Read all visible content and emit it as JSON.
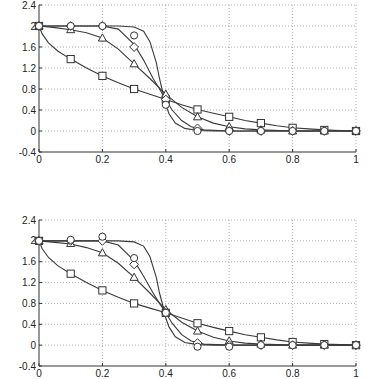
{
  "chart_data": [
    {
      "type": "line",
      "title": "",
      "xlabel": "",
      "ylabel": "",
      "xlim": [
        0,
        1
      ],
      "ylim": [
        -0.4,
        2.4
      ],
      "grid": true,
      "x_ticks": [
        "0",
        "0.2",
        "0.4",
        "0.6",
        "0.8",
        "1"
      ],
      "y_ticks": [
        "-0.4",
        "0",
        "0.4",
        "0.8",
        "1.2",
        "1.6",
        "2",
        "2.4"
      ],
      "x": [
        0,
        0.1,
        0.2,
        0.3,
        0.4,
        0.5,
        0.6,
        0.7,
        0.8,
        0.9,
        1.0
      ],
      "series": [
        {
          "name": "square",
          "marker": "square",
          "values": [
            2.0,
            1.37,
            1.05,
            0.8,
            0.6,
            0.41,
            0.27,
            0.15,
            0.06,
            0.02,
            0.0
          ]
        },
        {
          "name": "triangle",
          "marker": "triangle",
          "values": [
            2.0,
            1.93,
            1.77,
            1.28,
            0.7,
            0.27,
            0.08,
            0.02,
            0.0,
            0.0,
            0.0
          ]
        },
        {
          "name": "diamond",
          "marker": "diamond",
          "values": [
            2.0,
            2.0,
            2.0,
            1.6,
            0.6,
            0.05,
            0.0,
            0.0,
            0.0,
            0.0,
            0.0
          ]
        },
        {
          "name": "circle",
          "marker": "circle",
          "values": [
            2.0,
            2.0,
            2.0,
            1.82,
            0.5,
            0.0,
            0.0,
            0.0,
            0.0,
            0.0,
            0.0
          ]
        }
      ],
      "curves": [
        {
          "name": "curve-square",
          "points": [
            [
              0,
              2.0
            ],
            [
              0.01,
              1.85
            ],
            [
              0.03,
              1.68
            ],
            [
              0.06,
              1.52
            ],
            [
              0.1,
              1.37
            ],
            [
              0.15,
              1.2
            ],
            [
              0.2,
              1.05
            ],
            [
              0.25,
              0.92
            ],
            [
              0.3,
              0.8
            ],
            [
              0.35,
              0.7
            ],
            [
              0.4,
              0.6
            ],
            [
              0.45,
              0.5
            ],
            [
              0.5,
              0.41
            ],
            [
              0.55,
              0.34
            ],
            [
              0.6,
              0.27
            ],
            [
              0.65,
              0.2
            ],
            [
              0.7,
              0.15
            ],
            [
              0.75,
              0.1
            ],
            [
              0.8,
              0.06
            ],
            [
              0.85,
              0.04
            ],
            [
              0.9,
              0.02
            ],
            [
              0.95,
              0.01
            ],
            [
              1,
              0
            ]
          ]
        },
        {
          "name": "curve-triangle",
          "points": [
            [
              0,
              2.0
            ],
            [
              0.05,
              1.97
            ],
            [
              0.1,
              1.93
            ],
            [
              0.15,
              1.87
            ],
            [
              0.2,
              1.77
            ],
            [
              0.25,
              1.56
            ],
            [
              0.3,
              1.28
            ],
            [
              0.35,
              1.0
            ],
            [
              0.4,
              0.7
            ],
            [
              0.45,
              0.45
            ],
            [
              0.5,
              0.27
            ],
            [
              0.55,
              0.15
            ],
            [
              0.6,
              0.08
            ],
            [
              0.65,
              0.04
            ],
            [
              0.7,
              0.02
            ],
            [
              0.8,
              0.0
            ],
            [
              1,
              0
            ]
          ]
        },
        {
          "name": "curve-diamond",
          "points": [
            [
              0,
              2.0
            ],
            [
              0.2,
              2.0
            ],
            [
              0.25,
              1.94
            ],
            [
              0.3,
              1.65
            ],
            [
              0.33,
              1.35
            ],
            [
              0.36,
              1.0
            ],
            [
              0.38,
              0.8
            ],
            [
              0.4,
              0.6
            ],
            [
              0.42,
              0.4
            ],
            [
              0.45,
              0.2
            ],
            [
              0.48,
              0.08
            ],
            [
              0.52,
              0.02
            ],
            [
              0.6,
              0.0
            ],
            [
              1,
              0
            ]
          ]
        },
        {
          "name": "curve-steep",
          "points": [
            [
              0,
              2.0
            ],
            [
              0.25,
              2.0
            ],
            [
              0.3,
              1.98
            ],
            [
              0.33,
              1.9
            ],
            [
              0.35,
              1.7
            ],
            [
              0.37,
              1.3
            ],
            [
              0.38,
              1.0
            ],
            [
              0.39,
              0.75
            ],
            [
              0.4,
              0.5
            ],
            [
              0.41,
              0.33
            ],
            [
              0.43,
              0.15
            ],
            [
              0.46,
              0.05
            ],
            [
              0.5,
              0.01
            ],
            [
              0.55,
              0.0
            ],
            [
              1,
              0
            ]
          ]
        }
      ]
    },
    {
      "type": "line",
      "title": "",
      "xlabel": "",
      "ylabel": "",
      "xlim": [
        0,
        1
      ],
      "ylim": [
        -0.4,
        2.4
      ],
      "grid": true,
      "x_ticks": [
        "0",
        "0.2",
        "0.4",
        "0.6",
        "0.8",
        "1"
      ],
      "y_ticks": [
        "-0.4",
        "0",
        "0.4",
        "0.8",
        "1.2",
        "1.6",
        "2",
        "2.4"
      ],
      "x": [
        0,
        0.1,
        0.2,
        0.3,
        0.4,
        0.5,
        0.6,
        0.7,
        0.8,
        0.9,
        1.0
      ],
      "series": [
        {
          "name": "square",
          "marker": "square",
          "values": [
            2.0,
            1.37,
            1.05,
            0.8,
            0.62,
            0.42,
            0.27,
            0.15,
            0.06,
            0.02,
            0.0
          ]
        },
        {
          "name": "triangle",
          "marker": "triangle",
          "values": [
            2.0,
            1.95,
            1.77,
            1.3,
            0.68,
            0.27,
            0.08,
            0.02,
            0.0,
            0.0,
            0.0
          ]
        },
        {
          "name": "diamond",
          "marker": "diamond",
          "values": [
            2.0,
            2.0,
            2.0,
            1.55,
            0.62,
            0.04,
            0.0,
            0.0,
            0.0,
            0.0,
            0.0
          ]
        },
        {
          "name": "circle",
          "marker": "circle",
          "values": [
            2.0,
            2.02,
            2.08,
            1.67,
            0.62,
            -0.03,
            -0.03,
            0.0,
            0.0,
            0.0,
            0.0
          ]
        }
      ],
      "curves": [
        {
          "name": "curve-square",
          "points": [
            [
              0,
              2.0
            ],
            [
              0.01,
              1.85
            ],
            [
              0.03,
              1.68
            ],
            [
              0.06,
              1.52
            ],
            [
              0.1,
              1.37
            ],
            [
              0.15,
              1.2
            ],
            [
              0.2,
              1.05
            ],
            [
              0.25,
              0.92
            ],
            [
              0.3,
              0.8
            ],
            [
              0.35,
              0.71
            ],
            [
              0.4,
              0.62
            ],
            [
              0.45,
              0.52
            ],
            [
              0.5,
              0.42
            ],
            [
              0.55,
              0.34
            ],
            [
              0.6,
              0.27
            ],
            [
              0.65,
              0.2
            ],
            [
              0.7,
              0.15
            ],
            [
              0.75,
              0.1
            ],
            [
              0.8,
              0.06
            ],
            [
              0.85,
              0.04
            ],
            [
              0.9,
              0.02
            ],
            [
              0.95,
              0.01
            ],
            [
              1,
              0
            ]
          ]
        },
        {
          "name": "curve-triangle",
          "points": [
            [
              0,
              2.0
            ],
            [
              0.05,
              1.97
            ],
            [
              0.1,
              1.94
            ],
            [
              0.15,
              1.87
            ],
            [
              0.2,
              1.77
            ],
            [
              0.25,
              1.57
            ],
            [
              0.3,
              1.3
            ],
            [
              0.35,
              1.0
            ],
            [
              0.4,
              0.68
            ],
            [
              0.45,
              0.44
            ],
            [
              0.5,
              0.27
            ],
            [
              0.55,
              0.15
            ],
            [
              0.6,
              0.08
            ],
            [
              0.65,
              0.04
            ],
            [
              0.7,
              0.02
            ],
            [
              0.8,
              0.0
            ],
            [
              1,
              0
            ]
          ]
        },
        {
          "name": "curve-diamond",
          "points": [
            [
              0,
              2.0
            ],
            [
              0.2,
              2.0
            ],
            [
              0.25,
              1.92
            ],
            [
              0.3,
              1.62
            ],
            [
              0.33,
              1.32
            ],
            [
              0.36,
              1.0
            ],
            [
              0.38,
              0.8
            ],
            [
              0.4,
              0.62
            ],
            [
              0.42,
              0.42
            ],
            [
              0.45,
              0.2
            ],
            [
              0.48,
              0.08
            ],
            [
              0.52,
              0.02
            ],
            [
              0.6,
              0.0
            ],
            [
              1,
              0
            ]
          ]
        },
        {
          "name": "curve-steep",
          "points": [
            [
              0,
              2.0
            ],
            [
              0.25,
              2.0
            ],
            [
              0.3,
              1.98
            ],
            [
              0.33,
              1.9
            ],
            [
              0.35,
              1.7
            ],
            [
              0.37,
              1.3
            ],
            [
              0.38,
              1.0
            ],
            [
              0.39,
              0.78
            ],
            [
              0.4,
              0.52
            ],
            [
              0.41,
              0.35
            ],
            [
              0.43,
              0.16
            ],
            [
              0.46,
              0.05
            ],
            [
              0.5,
              0.01
            ],
            [
              0.55,
              0.0
            ],
            [
              1,
              0
            ]
          ]
        }
      ]
    }
  ]
}
